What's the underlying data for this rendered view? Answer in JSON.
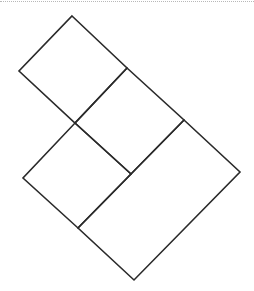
{
  "diagram": {
    "type": "tiled-rotated-rectangles",
    "stroke_color": "#2a2a2a",
    "background": "#ffffff",
    "top_rule_color": "#b8b8b8",
    "points": {
      "A": [
        72,
        16
      ],
      "B": [
        19,
        71
      ],
      "C": [
        127,
        68
      ],
      "D": [
        75,
        123
      ],
      "E": [
        184,
        120
      ],
      "F": [
        131,
        174
      ],
      "G": [
        23,
        178
      ],
      "H": [
        78,
        228
      ],
      "I": [
        240,
        172
      ],
      "J": [
        134,
        280
      ]
    },
    "shapes": [
      {
        "name": "square-top",
        "vertices": [
          "A",
          "C",
          "D",
          "B"
        ]
      },
      {
        "name": "square-middle",
        "vertices": [
          "C",
          "E",
          "F",
          "D"
        ]
      },
      {
        "name": "square-lower-left",
        "vertices": [
          "D",
          "F",
          "H",
          "G"
        ]
      },
      {
        "name": "rectangle-large",
        "vertices": [
          "E",
          "I",
          "J",
          "H"
        ]
      }
    ]
  }
}
